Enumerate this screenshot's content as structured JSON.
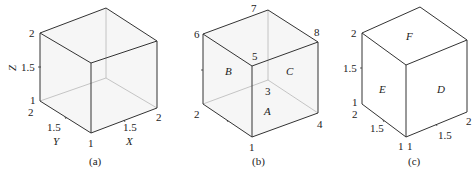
{
  "panels": {
    "a": {
      "caption": "(a)",
      "axis_labels": {
        "z": "Z",
        "y": "Y",
        "x": "X"
      },
      "z_ticks": [
        "2",
        "1.5",
        "1"
      ],
      "y_ticks": [
        "2",
        "1.5",
        "1"
      ],
      "x_ticks": [
        "1",
        "1.5",
        "2"
      ]
    },
    "b": {
      "caption": "(b)",
      "vertex_labels": [
        "1",
        "2",
        "3",
        "4",
        "5",
        "6",
        "7",
        "8"
      ],
      "face_labels": {
        "front": "A",
        "left": "B",
        "right": "C"
      }
    },
    "c": {
      "caption": "(c)",
      "z_ticks": [
        "2",
        "1.5",
        "1"
      ],
      "y_ticks": [
        "2",
        "1.5",
        "1"
      ],
      "x_ticks": [
        "1",
        "1.5",
        "2"
      ],
      "face_labels": {
        "right": "D",
        "left": "E",
        "top": "F"
      }
    }
  },
  "colors": {
    "edge": "#333333",
    "hidden_edge": "#b8b8b8",
    "face_fill": "#efefef"
  }
}
